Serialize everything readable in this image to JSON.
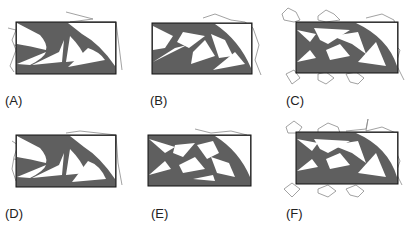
{
  "figure": {
    "panels": [
      {
        "id": "A",
        "label": "(A)"
      },
      {
        "id": "B",
        "label": "(B)"
      },
      {
        "id": "C",
        "label": "(C)"
      },
      {
        "id": "D",
        "label": "(D)"
      },
      {
        "id": "E",
        "label": "(E)"
      },
      {
        "id": "F",
        "label": "(F)"
      }
    ],
    "colors": {
      "material": "#5f5f5f",
      "frame": "#111111",
      "deformed_outline": "#8a8a8a",
      "background": "#ffffff"
    }
  }
}
